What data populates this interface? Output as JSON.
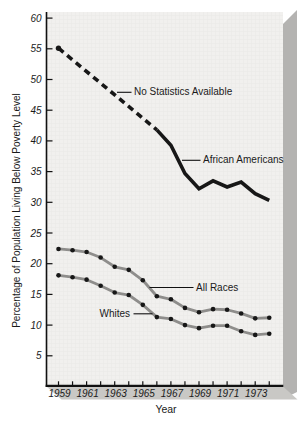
{
  "chart_data": {
    "type": "line",
    "title": "",
    "xlabel": "Year",
    "ylabel": "Percentage of Population Living Below Poverty Level",
    "xlim": [
      1958.2,
      1975.2
    ],
    "ylim": [
      0,
      61
    ],
    "grid": false,
    "x_years": [
      1959,
      1960,
      1961,
      1962,
      1963,
      1964,
      1965,
      1966,
      1967,
      1968,
      1969,
      1970,
      1971,
      1972,
      1973,
      1974
    ],
    "x_tick_labels": [
      "1959",
      "1961",
      "1963",
      "1965",
      "1967",
      "1969",
      "1971",
      "1973"
    ],
    "x_tick_label_years": [
      1959,
      1961,
      1963,
      1965,
      1967,
      1969,
      1971,
      1973
    ],
    "y_ticks": [
      5,
      10,
      15,
      20,
      25,
      30,
      35,
      40,
      45,
      50,
      55,
      60
    ],
    "series": [
      {
        "name": "African Americans",
        "style": "thick-black-solid",
        "x": [
          1966,
          1967,
          1968,
          1969,
          1970,
          1971,
          1972,
          1973,
          1974
        ],
        "values": [
          41.8,
          39.3,
          34.7,
          32.2,
          33.5,
          32.5,
          33.3,
          31.4,
          30.3
        ]
      },
      {
        "name": "African Americans (no statistics available)",
        "style": "thick-black-dashed",
        "x": [
          1959,
          1966
        ],
        "values": [
          55.1,
          41.8
        ],
        "start_marker": true
      },
      {
        "name": "All Races",
        "style": "gray-line-black-dots",
        "x": [
          1959,
          1960,
          1961,
          1962,
          1963,
          1964,
          1965,
          1966,
          1967,
          1968,
          1969,
          1970,
          1971,
          1972,
          1973,
          1974
        ],
        "values": [
          22.4,
          22.2,
          21.9,
          21.0,
          19.5,
          19.0,
          17.3,
          14.7,
          14.2,
          12.8,
          12.1,
          12.6,
          12.5,
          11.9,
          11.1,
          11.2
        ]
      },
      {
        "name": "Whites",
        "style": "gray-line-black-dots",
        "x": [
          1959,
          1960,
          1961,
          1962,
          1963,
          1964,
          1965,
          1966,
          1967,
          1968,
          1969,
          1970,
          1971,
          1972,
          1973,
          1974
        ],
        "values": [
          18.1,
          17.8,
          17.4,
          16.4,
          15.3,
          14.9,
          13.3,
          11.3,
          11.0,
          10.0,
          9.5,
          9.9,
          9.9,
          9.0,
          8.4,
          8.6
        ]
      }
    ],
    "annotations": {
      "no_stats": {
        "text": "No Statistics Available"
      },
      "african_americans": {
        "text": "African Americans"
      },
      "all_races": {
        "text": "All Races"
      },
      "whites": {
        "text": "Whites"
      }
    }
  },
  "colors": {
    "background": "#ffffff",
    "panel_face": "#f1f0ee",
    "panel_side": "#b4b3b1",
    "panel_bottom": "#c9c8c5",
    "grid_line": "#e5e4e1",
    "axis": "#111111",
    "series_gray": "#8e8d8b",
    "series_black": "#171717",
    "text": "#1a1a1a"
  }
}
